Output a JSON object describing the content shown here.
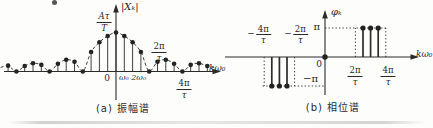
{
  "figure": {
    "caption_a": "(a) 振幅谱",
    "caption_b": "(b) 相位谱"
  },
  "chart_data": [
    {
      "id": "amplitude-spectrum",
      "type": "stem",
      "title": "(a) 振幅谱",
      "ylabel": "|Xₖ|",
      "xlabel": "kω₀",
      "peak_value_label": {
        "numerator": "Aτ",
        "denominator": "T"
      },
      "envelope": {
        "shape": "abs-sinc",
        "style": "dashed",
        "zeros_at_k": [
          -12,
          -8,
          -4,
          4,
          8
        ]
      },
      "annotations": {
        "origin": "0",
        "first_harmonics": "ω₀ 2ω₀",
        "first_zero": {
          "numerator": "2π",
          "denominator": "τ",
          "at_k": 4
        },
        "second_zero": {
          "numerator": "4π",
          "denominator": "τ",
          "at_k": 8
        }
      },
      "samples": {
        "k": [
          -13,
          -12,
          -11,
          -10,
          -9,
          -8,
          -7,
          -6,
          -5,
          -4,
          -3,
          -2,
          -1,
          0,
          1,
          2,
          3,
          4,
          5,
          6,
          7,
          8,
          9,
          10,
          11
        ],
        "amplitude": [
          0.15,
          0,
          0.14,
          0.21,
          0.17,
          0,
          0.2,
          0.3,
          0.25,
          0,
          0.5,
          0.75,
          0.91,
          1,
          0.91,
          0.75,
          0.5,
          0,
          0.25,
          0.3,
          0.2,
          0,
          0.17,
          0.21,
          0.14
        ]
      },
      "peak_value": "Aτ/T",
      "x_spacing_unit": "ω₀"
    },
    {
      "id": "phase-spectrum",
      "type": "stem",
      "title": "(b) 相位谱",
      "ylabel": "φₖ",
      "xlabel": "kω₀",
      "y_ticks": [
        {
          "label": "π",
          "value": 1
        },
        {
          "label": "−π",
          "value": -1
        }
      ],
      "origin_label": "0",
      "x_tick_labels": [
        {
          "sign": "−",
          "numerator": "4π",
          "denominator": "τ",
          "at_k": -8
        },
        {
          "sign": "−",
          "numerator": "2π",
          "denominator": "τ",
          "at_k": -4
        },
        {
          "sign": "",
          "numerator": "2π",
          "denominator": "τ",
          "at_k": 4
        },
        {
          "sign": "",
          "numerator": "4π",
          "denominator": "τ",
          "at_k": 8
        }
      ],
      "samples": {
        "k": [
          -7,
          -6,
          -5,
          0,
          5,
          6,
          7
        ],
        "phase_over_pi": [
          -1,
          -1,
          -1,
          0,
          1,
          1,
          1
        ],
        "phase_labels": [
          "−π",
          "−π",
          "−π",
          "0",
          "π",
          "π",
          "π"
        ]
      },
      "guides": {
        "vertical_at_k": [
          -8,
          -4,
          4,
          8
        ],
        "horizontal_levels": [
          1,
          -1
        ],
        "style": "dotted"
      }
    }
  ]
}
